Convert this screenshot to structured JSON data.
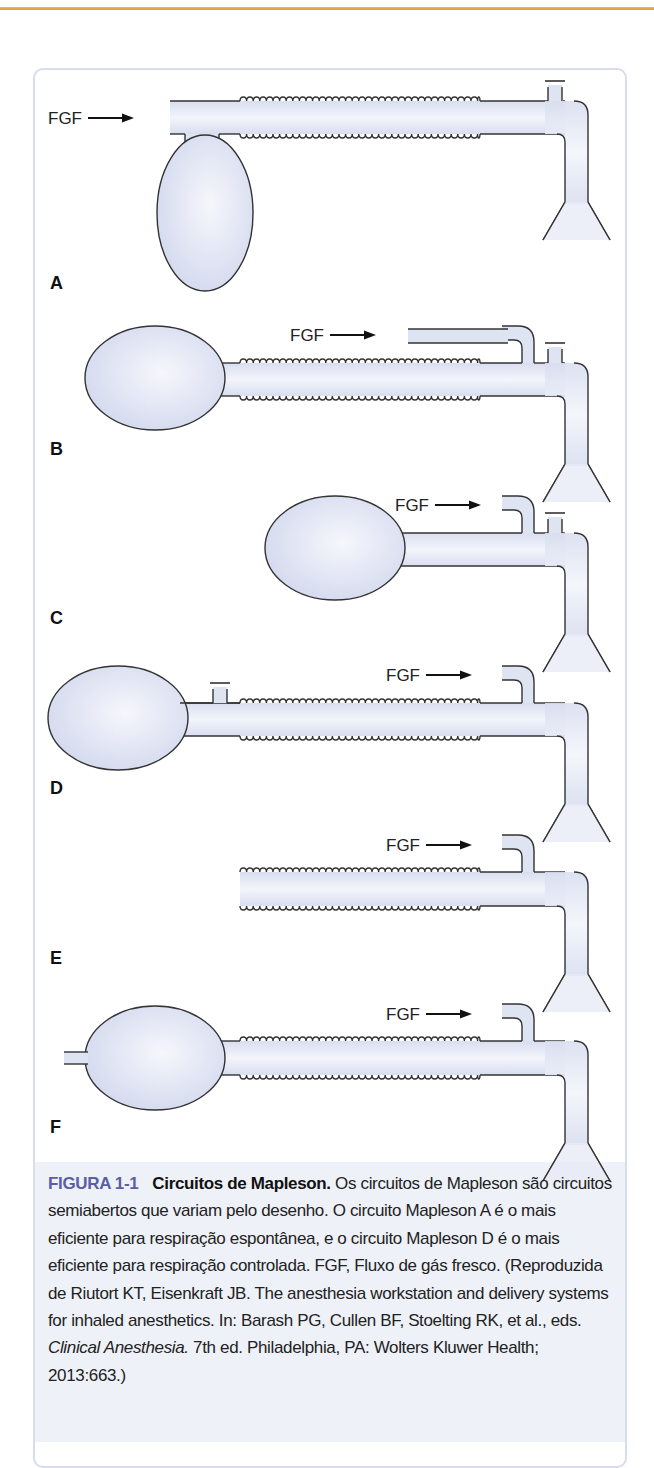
{
  "figure": {
    "number": "FIGURA 1-1",
    "title": "Circuitos de Mapleson.",
    "caption_before_italic": "Os circuitos de Mapleson são circuitos semiabertos que variam pelo desenho. O circuito Mapleson A é o mais eficiente para respiração espontânea, e o circuito Mapleson D é o mais eficiente para respiração controlada. FGF, Fluxo de gás fresco. (Reproduzida de Riutort KT, Eisenkraft JB. The anesthesia workstation and delivery systems for inhaled anesthetics. In: Barash PG, Cullen BF, Stoelting RK, et al., eds.",
    "caption_italic": "Clinical Anesthesia.",
    "caption_after_italic": "7th ed. Philadelphia, PA: Wolters Kluwer Health; 2013:663.)"
  },
  "panels": [
    {
      "label": "A",
      "fgf_label": "FGF",
      "components": [
        "fresh gas inlet",
        "corrugated tubing",
        "APL valve near patient",
        "reservoir bag at inlet end",
        "patient mask connector"
      ]
    },
    {
      "label": "B",
      "fgf_label": "FGF",
      "components": [
        "reservoir bag",
        "corrugated tubing",
        "fresh gas inlet near patient",
        "APL valve near patient",
        "patient mask connector"
      ]
    },
    {
      "label": "C",
      "fgf_label": "FGF",
      "components": [
        "reservoir bag",
        "short tubing",
        "fresh gas inlet near patient",
        "APL valve near patient",
        "patient mask connector"
      ]
    },
    {
      "label": "D",
      "fgf_label": "FGF",
      "components": [
        "reservoir bag",
        "APL valve near bag",
        "corrugated tubing",
        "fresh gas inlet near patient",
        "patient mask connector"
      ]
    },
    {
      "label": "E",
      "fgf_label": "FGF",
      "components": [
        "open corrugated tubing",
        "fresh gas inlet near patient",
        "patient mask connector"
      ]
    },
    {
      "label": "F",
      "fgf_label": "FGF",
      "components": [
        "open-tailed reservoir bag",
        "corrugated tubing",
        "fresh gas inlet near patient",
        "patient mask connector"
      ]
    }
  ],
  "colors": {
    "accent_rule": "#e9953a",
    "figure_number": "#5b5ea6",
    "tube_fill": "#dfe4f3",
    "card_border": "#d7dded",
    "caption_band": "#eef1f8"
  }
}
